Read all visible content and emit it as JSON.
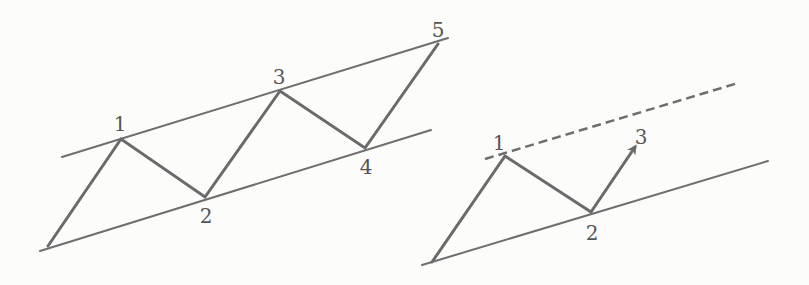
{
  "diagrams": [
    {
      "name": "completed-five-wave-channel",
      "labels": [
        "1",
        "2",
        "3",
        "4",
        "5"
      ],
      "upper_line": {
        "x1": 62,
        "y1": 157,
        "x2": 448,
        "y2": 38
      },
      "lower_line": {
        "x1": 40,
        "y1": 251,
        "x2": 431,
        "y2": 130
      },
      "wave_points": [
        [
          48,
          246
        ],
        [
          121,
          139
        ],
        [
          205,
          197
        ],
        [
          280,
          91
        ],
        [
          365,
          148
        ],
        [
          438,
          44
        ]
      ],
      "label_positions": [
        [
          120,
          131
        ],
        [
          206,
          223
        ],
        [
          279,
          84
        ],
        [
          366,
          174
        ],
        [
          438,
          37
        ]
      ]
    },
    {
      "name": "projected-channel",
      "labels": [
        "1",
        "2",
        "3"
      ],
      "dashed_line": {
        "x1": 485,
        "y1": 159,
        "x2": 738,
        "y2": 83
      },
      "lower_line": {
        "x1": 422,
        "y1": 265,
        "x2": 768,
        "y2": 161
      },
      "wave_points": [
        [
          432,
          262
        ],
        [
          505,
          156
        ],
        [
          591,
          212
        ]
      ],
      "arrow": {
        "x1": 591,
        "y1": 212,
        "x2": 635,
        "y2": 147
      },
      "label_positions": [
        [
          499,
          150
        ],
        [
          592,
          240
        ],
        [
          641,
          144
        ]
      ]
    }
  ],
  "colors": {
    "background": "#fcfcfb",
    "lines": "#6e6e6e",
    "labels": "#555555"
  }
}
